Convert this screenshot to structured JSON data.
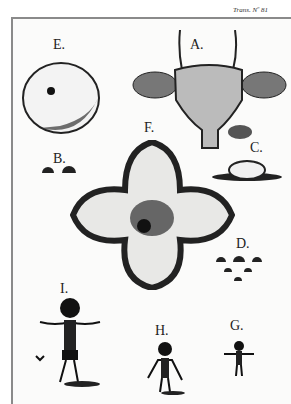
{
  "plate": {
    "header_note": "Trans. Nº 81",
    "figures": [
      {
        "id": "A",
        "label": "A."
      },
      {
        "id": "B",
        "label": "B."
      },
      {
        "id": "C",
        "label": "C."
      },
      {
        "id": "D",
        "label": "D."
      },
      {
        "id": "E",
        "label": "E."
      },
      {
        "id": "F",
        "label": "F."
      },
      {
        "id": "G",
        "label": "G."
      },
      {
        "id": "H",
        "label": "H."
      },
      {
        "id": "I",
        "label": "I."
      }
    ],
    "colors": {
      "ink": "#1a1a1a",
      "paper": "#fbfbfa",
      "border": "#8a8a8a"
    }
  }
}
